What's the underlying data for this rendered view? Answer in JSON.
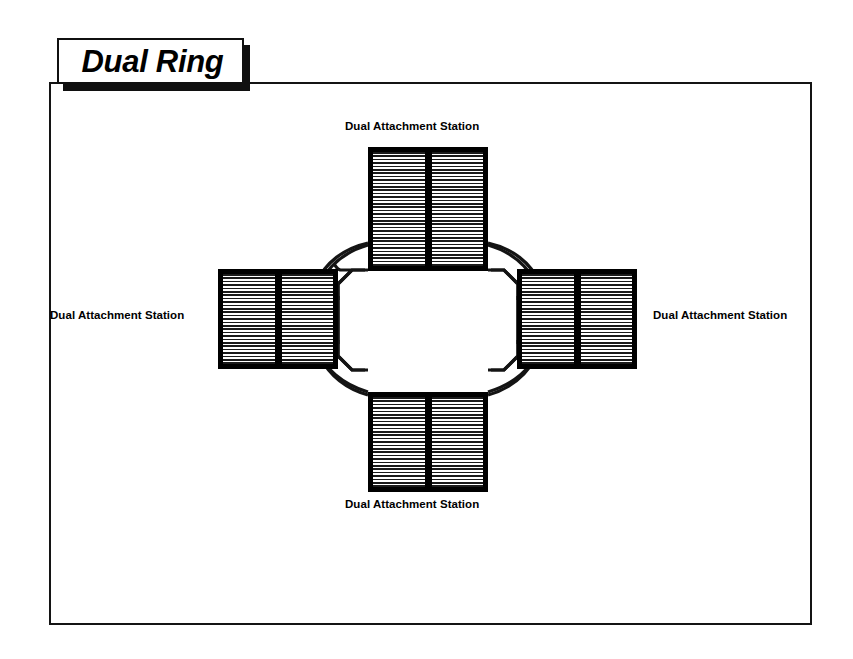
{
  "figure": {
    "title": "Dual Ring",
    "type": "network-topology-diagram"
  },
  "colors": {
    "line": "#141414",
    "fill": "#000000",
    "background": "#ffffff",
    "hatch": "#1a1a1a"
  },
  "stations": [
    {
      "id": "top",
      "label": "Dual Attachment Station",
      "position": "top",
      "panels": 2
    },
    {
      "id": "right",
      "label": "Dual Attachment Station",
      "position": "right",
      "panels": 2
    },
    {
      "id": "bottom",
      "label": "Dual Attachment Station",
      "position": "bottom",
      "panels": 2
    },
    {
      "id": "left",
      "label": "Dual Attachment Station",
      "position": "left",
      "panels": 2
    }
  ],
  "ring": {
    "count": 2,
    "names": [
      "outer-ring",
      "inner-ring"
    ],
    "shape": "octagonal-dual-ring"
  }
}
